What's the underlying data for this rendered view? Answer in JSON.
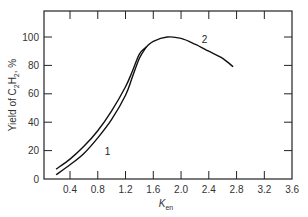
{
  "chart_data": {
    "type": "line",
    "title": "",
    "xlabel": "K",
    "xlabel_subscript": "en",
    "ylabel": "Yield of C2H2, %",
    "ylabel_parts": {
      "prefix": "Yield of C",
      "sub1": "2",
      "mid": "H",
      "sub2": "2",
      "suffix": ", %"
    },
    "xlim": [
      0.0,
      3.6
    ],
    "ylim": [
      0,
      116
    ],
    "xticks": [
      0.4,
      0.8,
      1.2,
      1.6,
      2.0,
      2.4,
      2.8,
      3.2,
      3.6
    ],
    "xtick_labels": [
      "0.4",
      "0.8",
      "1.2",
      "1.6",
      "2.0",
      "2.4",
      "2.8",
      "3.2",
      "3.6"
    ],
    "yticks": [
      0,
      20,
      40,
      60,
      80,
      100
    ],
    "ytick_labels": [
      "0",
      "20",
      "40",
      "60",
      "80",
      "100"
    ],
    "grid": false,
    "legend": "inline curve labels",
    "series": [
      {
        "name": "1",
        "x": [
          0.2,
          0.4,
          0.6,
          0.8,
          1.0,
          1.2,
          1.3,
          1.4,
          1.5
        ],
        "y": [
          3,
          10,
          18,
          29,
          42,
          59,
          72,
          85,
          93
        ],
        "label_pos": {
          "x": 0.9,
          "y": 17
        }
      },
      {
        "name": "2",
        "x": [
          0.2,
          0.4,
          0.6,
          0.8,
          1.0,
          1.2,
          1.3,
          1.4,
          1.5,
          1.6,
          1.8,
          2.0,
          2.2,
          2.4,
          2.6,
          2.75
        ],
        "y": [
          7,
          14,
          23,
          34,
          48,
          65,
          76,
          88,
          93,
          97,
          100,
          99,
          95,
          90,
          85,
          79
        ],
        "label_pos": {
          "x": 2.3,
          "y": 96
        }
      }
    ]
  }
}
